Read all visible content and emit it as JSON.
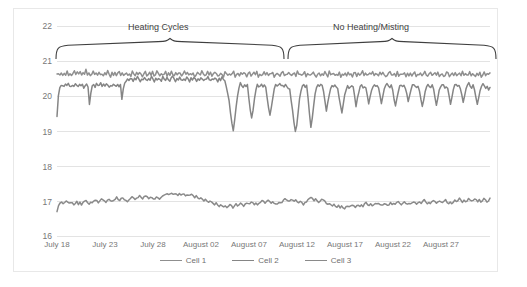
{
  "chart_data": {
    "type": "line",
    "title": "",
    "xlabel": "",
    "ylabel": "Oxygen %",
    "ylim": [
      16,
      22
    ],
    "yticks": [
      16,
      17,
      18,
      19,
      20,
      21,
      22
    ],
    "grid": true,
    "legend_position": "bottom",
    "x_tick_labels": [
      "July 18",
      "July 23",
      "July 28",
      "August 02",
      "August 07",
      "August 12",
      "August 17",
      "August 22",
      "August 27"
    ],
    "x_range_days": [
      0,
      45
    ],
    "annotations": [
      {
        "text": "Heating Cycles",
        "type": "curly-brace",
        "x_start_day": 0,
        "x_end_day": 24
      },
      {
        "text": "No Heating/Misting",
        "type": "curly-brace",
        "x_start_day": 24,
        "x_end_day": 45
      }
    ],
    "colors": {
      "cell1": "#8f8f8f",
      "cell2": "#858585",
      "cell3": "#8a8a8a",
      "grid": "#e3e3e3",
      "frame": "#e8e8e8"
    },
    "series": [
      {
        "name": "Cell 1",
        "color": "#8f8f8f",
        "values": [
          20.62,
          20.66,
          20.6,
          20.64,
          20.58,
          20.66,
          20.62,
          20.7,
          20.6,
          20.64,
          20.58,
          20.66,
          20.72,
          20.6,
          20.68,
          20.62,
          20.7,
          20.58,
          20.66,
          20.62,
          20.74,
          20.6,
          20.68,
          20.56,
          20.64,
          20.72,
          20.6,
          20.66,
          20.58,
          20.7,
          20.62,
          20.64,
          20.58,
          20.68,
          20.6,
          20.72,
          20.62,
          20.56,
          20.66,
          20.6,
          20.68,
          20.58,
          20.64,
          20.7,
          20.6,
          20.66,
          20.58,
          20.62,
          20.68,
          20.6,
          20.64,
          20.56,
          20.7,
          20.62,
          20.58,
          20.66,
          20.6,
          20.68,
          20.62,
          20.56,
          20.64,
          20.7,
          20.58,
          20.62,
          20.66,
          20.6,
          20.68,
          20.56,
          20.62,
          20.7,
          20.64,
          20.58,
          20.66,
          20.6,
          20.62,
          20.68,
          20.56,
          20.64,
          20.6,
          20.7,
          20.62,
          20.58,
          20.66,
          20.6,
          20.64,
          20.68,
          20.56,
          20.62,
          20.7,
          20.6,
          20.66,
          20.58,
          20.64,
          20.62,
          20.68,
          20.56,
          20.6,
          20.66,
          20.62,
          20.58,
          20.7,
          20.64,
          20.56,
          20.62,
          20.68,
          20.6,
          20.66,
          20.58,
          20.62,
          20.7,
          20.64,
          20.58,
          20.6,
          20.66,
          20.62,
          20.56,
          20.68,
          20.64,
          20.58,
          20.62,
          20.6,
          20.66,
          20.7,
          20.56,
          20.62,
          20.64,
          20.58,
          20.68,
          20.6,
          20.66,
          20.62,
          20.56,
          20.64,
          20.7,
          20.58,
          20.6,
          20.66,
          20.62,
          20.68,
          20.56,
          20.64,
          20.58,
          20.62,
          20.7,
          20.6,
          20.66,
          20.58,
          20.62,
          20.64,
          20.68,
          20.56,
          20.6,
          20.66,
          20.62,
          20.58,
          20.64,
          20.7,
          20.56,
          20.62,
          20.6,
          20.68,
          20.64,
          20.58,
          20.62,
          20.66,
          20.56,
          20.7,
          20.6,
          20.64,
          20.58,
          20.62,
          20.68,
          20.56,
          20.66,
          20.6,
          20.62,
          20.64,
          20.7,
          20.58,
          20.56,
          20.62,
          20.66,
          20.6,
          20.64,
          20.58,
          20.68,
          20.62,
          20.56,
          20.7,
          20.6,
          20.64,
          20.66,
          20.58,
          20.62,
          20.6,
          20.68,
          20.56,
          20.64,
          20.62,
          20.66,
          20.58,
          20.7,
          20.6,
          20.62,
          20.56,
          20.64,
          20.68,
          20.58,
          20.66,
          20.6,
          20.62,
          20.7,
          20.56,
          20.64,
          20.58,
          20.6,
          20.66,
          20.62,
          20.68,
          20.56,
          20.62,
          20.64,
          20.58,
          20.7,
          20.6,
          20.66,
          20.62,
          20.56,
          20.58,
          20.64,
          20.68,
          20.6,
          20.62,
          20.66,
          20.56,
          20.7,
          20.58,
          20.64,
          20.6,
          20.62,
          20.68,
          20.56,
          20.66,
          20.6,
          20.64,
          20.58,
          20.62,
          20.7,
          20.56,
          20.64,
          20.6,
          20.66,
          20.58,
          20.62,
          20.68,
          20.6,
          20.56,
          20.64,
          20.7,
          20.58,
          20.62,
          20.66,
          20.6,
          20.68,
          20.56,
          20.62,
          20.64,
          20.58,
          20.6,
          20.7,
          20.66,
          20.56,
          20.62,
          20.64,
          20.58,
          20.68,
          20.6,
          20.62,
          20.66,
          20.56,
          20.7,
          20.58,
          20.64,
          20.6,
          20.62,
          20.68,
          20.56,
          20.66,
          20.62,
          20.58,
          20.64,
          20.6,
          20.7,
          20.56,
          20.62,
          20.68,
          20.58,
          20.64,
          20.6,
          20.66
        ]
      },
      {
        "name": "Cell 2",
        "color": "#858585",
        "values": [
          19.42,
          20.02,
          20.22,
          20.28,
          20.3,
          20.26,
          20.32,
          20.28,
          20.34,
          20.3,
          20.26,
          20.32,
          20.28,
          20.36,
          20.3,
          20.26,
          20.34,
          20.28,
          20.32,
          20.24,
          20.3,
          20.34,
          20.28,
          19.74,
          20.1,
          20.28,
          20.32,
          20.26,
          20.34,
          20.28,
          20.3,
          20.36,
          20.26,
          20.32,
          20.28,
          20.34,
          20.3,
          20.26,
          20.32,
          20.28,
          20.36,
          20.3,
          20.26,
          20.34,
          20.28,
          20.32,
          19.9,
          20.2,
          20.38,
          20.44,
          20.5,
          20.46,
          20.52,
          20.48,
          20.42,
          20.5,
          20.46,
          20.54,
          20.48,
          20.42,
          20.5,
          20.46,
          20.52,
          20.48,
          20.44,
          20.5,
          20.46,
          20.54,
          20.48,
          20.42,
          20.5,
          20.46,
          20.52,
          20.48,
          20.44,
          20.56,
          20.5,
          20.46,
          20.52,
          20.48,
          20.44,
          20.5,
          20.56,
          20.48,
          20.42,
          20.5,
          20.46,
          20.52,
          20.48,
          20.44,
          20.5,
          20.46,
          20.54,
          20.48,
          20.42,
          20.5,
          20.46,
          20.52,
          20.48,
          20.44,
          20.5,
          20.46,
          20.52,
          20.48,
          20.42,
          20.5,
          20.46,
          20.54,
          20.48,
          20.44,
          20.5,
          20.46,
          20.52,
          20.48,
          20.42,
          20.5,
          20.46,
          20.54,
          20.48,
          20.44,
          20.26,
          20.06,
          19.86,
          19.52,
          19.22,
          19.0,
          19.34,
          19.7,
          20.02,
          20.24,
          20.36,
          20.3,
          20.26,
          20.32,
          20.28,
          20.34,
          19.96,
          19.62,
          19.36,
          19.58,
          19.92,
          20.18,
          20.32,
          20.26,
          20.3,
          20.34,
          20.28,
          20.32,
          20.26,
          19.94,
          19.66,
          19.44,
          19.68,
          19.96,
          20.2,
          20.32,
          20.26,
          20.3,
          20.34,
          20.28,
          20.3,
          20.26,
          20.32,
          20.28,
          20.22,
          20.18,
          19.9,
          19.58,
          19.26,
          18.98,
          19.18,
          19.56,
          19.92,
          20.14,
          20.28,
          20.32,
          20.26,
          20.3,
          19.92,
          19.48,
          19.08,
          19.36,
          19.74,
          20.04,
          20.22,
          20.3,
          20.26,
          20.32,
          20.28,
          20.14,
          19.86,
          19.58,
          19.8,
          20.04,
          20.22,
          20.3,
          20.24,
          20.3,
          20.26,
          20.2,
          19.96,
          19.74,
          19.52,
          19.76,
          20.02,
          20.18,
          20.28,
          20.22,
          20.26,
          20.3,
          20.24,
          19.98,
          19.7,
          19.92,
          20.12,
          20.26,
          20.3,
          20.24,
          20.28,
          20.22,
          20.04,
          19.8,
          19.96,
          20.16,
          20.28,
          20.32,
          20.26,
          20.3,
          20.22,
          20.02,
          19.78,
          19.98,
          20.18,
          20.3,
          20.34,
          20.28,
          20.24,
          20.3,
          20.16,
          19.92,
          19.72,
          19.94,
          20.14,
          20.28,
          20.32,
          20.26,
          20.3,
          20.24,
          20.06,
          19.82,
          20.0,
          20.18,
          20.3,
          20.34,
          20.28,
          20.22,
          20.28,
          20.14,
          19.9,
          19.68,
          19.9,
          20.12,
          20.26,
          20.32,
          20.28,
          20.22,
          20.3,
          20.18,
          19.96,
          19.76,
          19.96,
          20.16,
          20.28,
          20.34,
          20.3,
          20.24,
          20.28,
          20.2,
          19.98,
          19.78,
          19.98,
          20.18,
          20.3,
          20.34,
          20.26,
          20.3,
          20.22,
          20.02,
          19.82,
          20.02,
          20.2,
          20.32,
          20.36,
          20.28,
          20.24,
          20.3,
          20.18,
          19.96,
          19.76,
          19.96,
          20.18,
          20.3,
          20.34,
          20.28,
          20.22,
          20.28,
          20.16,
          20.22
        ]
      },
      {
        "name": "Cell 3",
        "color": "#8a8a8a",
        "values": [
          16.72,
          16.86,
          16.94,
          16.98,
          16.94,
          16.98,
          17.0,
          16.96,
          16.92,
          16.96,
          16.94,
          16.9,
          16.94,
          16.98,
          16.92,
          16.96,
          16.9,
          16.94,
          16.98,
          17.0,
          16.96,
          16.92,
          16.96,
          16.94,
          17.0,
          17.04,
          17.0,
          16.96,
          17.0,
          17.04,
          17.06,
          17.02,
          16.98,
          17.02,
          17.06,
          17.02,
          16.98,
          17.02,
          17.06,
          17.1,
          17.06,
          17.02,
          17.06,
          17.1,
          17.06,
          17.02,
          17.0,
          17.04,
          17.08,
          17.12,
          17.08,
          17.04,
          17.08,
          17.12,
          17.16,
          17.12,
          17.08,
          17.12,
          17.16,
          17.12,
          17.08,
          17.12,
          17.08,
          17.04,
          17.08,
          17.12,
          17.08,
          17.04,
          17.08,
          17.12,
          17.16,
          17.2,
          17.22,
          17.18,
          17.2,
          17.22,
          17.18,
          17.2,
          17.22,
          17.18,
          17.2,
          17.16,
          17.18,
          17.2,
          17.16,
          17.18,
          17.14,
          17.16,
          17.18,
          17.14,
          17.1,
          17.14,
          17.1,
          17.06,
          17.1,
          17.06,
          17.02,
          17.06,
          17.02,
          16.98,
          17.02,
          16.98,
          16.94,
          16.9,
          16.94,
          16.9,
          16.86,
          16.9,
          16.86,
          16.82,
          16.86,
          16.82,
          16.86,
          16.9,
          16.86,
          16.82,
          16.86,
          16.9,
          16.86,
          16.9,
          16.94,
          16.9,
          16.86,
          16.9,
          16.94,
          16.9,
          16.94,
          16.98,
          16.94,
          16.9,
          16.94,
          16.9,
          16.94,
          16.98,
          17.02,
          16.98,
          16.94,
          16.98,
          17.02,
          16.98,
          16.94,
          16.98,
          16.94,
          16.9,
          16.94,
          16.98,
          16.94,
          16.98,
          17.02,
          17.06,
          17.02,
          16.98,
          17.02,
          17.06,
          17.02,
          16.98,
          17.02,
          16.98,
          16.94,
          16.98,
          16.94,
          16.9,
          16.94,
          16.98,
          17.02,
          17.06,
          17.1,
          17.06,
          17.02,
          17.06,
          17.02,
          16.98,
          17.02,
          17.06,
          17.02,
          16.98,
          16.94,
          16.9,
          16.94,
          16.9,
          16.86,
          16.9,
          16.86,
          16.82,
          16.86,
          16.82,
          16.86,
          16.82,
          16.78,
          16.82,
          16.86,
          16.82,
          16.86,
          16.9,
          16.86,
          16.82,
          16.86,
          16.9,
          16.86,
          16.9,
          16.86,
          16.9,
          16.94,
          16.9,
          16.86,
          16.9,
          16.86,
          16.9,
          16.94,
          16.9,
          16.94,
          16.9,
          16.86,
          16.9,
          16.94,
          16.9,
          16.86,
          16.9,
          16.94,
          16.9,
          16.94,
          16.9,
          16.94,
          16.98,
          16.94,
          16.9,
          16.94,
          16.98,
          16.94,
          16.9,
          16.94,
          16.9,
          16.94,
          16.98,
          16.94,
          16.9,
          16.94,
          16.98,
          16.94,
          16.98,
          17.02,
          16.98,
          16.94,
          16.98,
          16.94,
          16.98,
          17.02,
          16.98,
          16.94,
          16.98,
          17.02,
          16.98,
          16.94,
          16.98,
          17.02,
          16.98,
          16.94,
          16.98,
          16.94,
          16.98,
          17.02,
          16.98,
          17.02,
          17.06,
          17.02,
          16.98,
          17.02,
          16.98,
          17.02,
          17.06,
          17.02,
          16.98,
          17.02,
          17.06,
          17.02,
          16.98,
          17.02,
          16.98,
          17.02,
          17.06,
          17.02,
          16.98,
          17.02,
          17.06
        ]
      }
    ]
  }
}
